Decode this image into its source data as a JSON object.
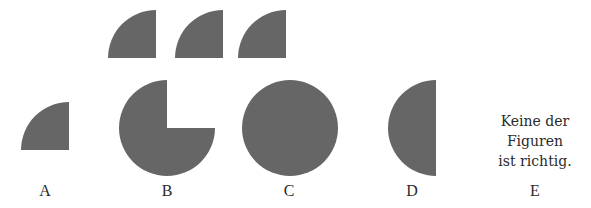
{
  "figure": {
    "fill_color": "#666666",
    "background_color": "#ffffff",
    "given_pieces": [
      {
        "shape": "quarter-circle",
        "orientation": "top-left quadrant"
      },
      {
        "shape": "quarter-circle",
        "orientation": "top-left quadrant"
      },
      {
        "shape": "quarter-circle",
        "orientation": "top-left quadrant"
      }
    ]
  },
  "options": [
    {
      "label": "A",
      "shape": "quarter-circle",
      "description": "single quarter circle"
    },
    {
      "label": "B",
      "shape": "three-quarter-circle",
      "description": "circle with top-right quadrant missing"
    },
    {
      "label": "C",
      "shape": "full-circle",
      "description": "full circle"
    },
    {
      "label": "D",
      "shape": "half-circle",
      "description": "left half circle"
    },
    {
      "label": "E",
      "shape": "text",
      "description": "none of the figures is correct"
    }
  ],
  "option_e_text": {
    "line1": "Keine der",
    "line2": "Figuren",
    "line3": "ist richtig."
  }
}
